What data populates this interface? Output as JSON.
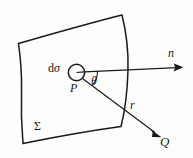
{
  "figure": {
    "kind": "vector-diagram",
    "background_color": "#fdfdfc",
    "ink_color": "#1a1a1a",
    "labels": {
      "surface_element": "dσ",
      "surface_element_d": "d",
      "surface_element_sigma": "σ",
      "point_p": "P",
      "angle": "θ",
      "normal_vector": "n",
      "distance_vector": "r",
      "point_q": "Q",
      "surface": "Σ"
    },
    "elements": [
      {
        "name": "surface-patch",
        "label": "Σ",
        "shape": "curved-quadrilateral"
      },
      {
        "name": "area-element-circle",
        "label": "dσ",
        "shape": "small-circle"
      },
      {
        "name": "point-p-marker",
        "label": "P"
      },
      {
        "name": "normal-arrow",
        "label": "n",
        "direction": "right"
      },
      {
        "name": "r-arrow",
        "label": "r",
        "direction": "down-right"
      },
      {
        "name": "angle-arc",
        "label": "θ"
      },
      {
        "name": "point-q-marker",
        "label": "Q"
      }
    ]
  }
}
